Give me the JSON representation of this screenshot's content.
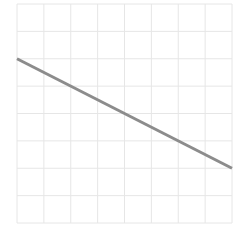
{
  "chart_data": {
    "type": "line",
    "title": "",
    "xlabel": "",
    "ylabel": "",
    "grid": true,
    "legend": null,
    "xlim": [
      0,
      8
    ],
    "ylim": [
      0,
      8
    ],
    "x_ticks": [
      0,
      1,
      2,
      3,
      4,
      5,
      6,
      7,
      8
    ],
    "y_ticks": [
      0,
      1,
      2,
      3,
      4,
      5,
      6,
      7,
      8
    ],
    "tick_labels_visible": false,
    "series": [
      {
        "name": "line",
        "x": [
          0,
          8
        ],
        "y": [
          6,
          2
        ],
        "color": "#8c8c8c"
      }
    ]
  },
  "style": {
    "grid_color": "#e6e6e6",
    "background": "#ffffff",
    "line_width": 3
  },
  "plot_area": {
    "left": 17,
    "top": 4,
    "width": 215,
    "height": 219
  }
}
